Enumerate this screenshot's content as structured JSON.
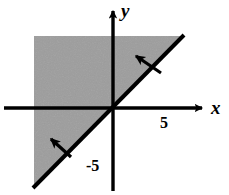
{
  "figure": {
    "kind": "coordinate-plane-inequality-graph",
    "width": 229,
    "height": 195,
    "background_color": "#ffffff",
    "stroke_color": "#000000",
    "shade_color": "#9d9d9d"
  },
  "axes": {
    "x_label": "x",
    "y_label": "y",
    "origin_px": {
      "x": 113,
      "y": 108
    },
    "x_axis_px": {
      "start_x": 4,
      "end_x": 207,
      "y": 108
    },
    "y_axis_px": {
      "x": 113,
      "start_y": 5,
      "end_y": 191
    }
  },
  "tick_labels": [
    {
      "text": "5",
      "axis": "x",
      "value": 5
    },
    {
      "text": "-5",
      "axis": "y",
      "value": -5
    }
  ],
  "boundary_line": {
    "description": "solid line through the origin with slope 1",
    "slope": 1,
    "intercept": 0,
    "style": "solid",
    "endpoints_px": [
      {
        "x": 33,
        "y": 188
      },
      {
        "x": 184,
        "y": 35
      }
    ]
  },
  "shaded_region": {
    "description": "region above and to the left of the line y = x",
    "inequality": "y >= x",
    "fill_color": "#9d9d9d",
    "polygon_px": "34,36 182,36 34,186"
  },
  "direction_arrows": [
    {
      "name": "upper-shade-arrow",
      "tail_px": {
        "x": 160,
        "y": 72
      },
      "tip_px": {
        "x": 130,
        "y": 52
      }
    },
    {
      "name": "lower-shade-arrow",
      "tail_px": {
        "x": 70,
        "y": 156
      },
      "tip_px": {
        "x": 45,
        "y": 134
      }
    }
  ]
}
